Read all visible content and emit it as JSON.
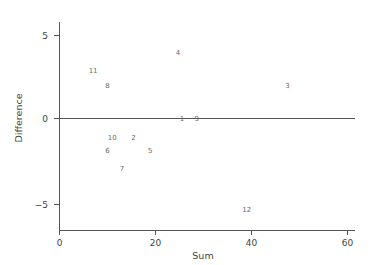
{
  "chart_data": {
    "type": "scatter",
    "title": "",
    "xlabel": "Sum",
    "ylabel": "Difference",
    "xlim": [
      0,
      60
    ],
    "ylim": [
      -6,
      6
    ],
    "xticks": [
      0,
      20,
      40,
      60
    ],
    "xticklabels": [
      "0",
      "20",
      "40",
      "60"
    ],
    "yticks": [
      5,
      0,
      -5
    ],
    "yticklabels": [
      "5",
      "0",
      "−5"
    ],
    "grid": false,
    "legend": null,
    "reference_line": {
      "orientation": "horizontal",
      "y": 0
    },
    "marker_style": "text-label",
    "points": [
      {
        "label": "11",
        "x": 7.0,
        "y": 2.9
      },
      {
        "label": "8",
        "x": 10.0,
        "y": 2.0
      },
      {
        "label": "4",
        "x": 24.7,
        "y": 4.0
      },
      {
        "label": "3",
        "x": 47.5,
        "y": 2.0
      },
      {
        "label": "1",
        "x": 25.5,
        "y": 0.0
      },
      {
        "label": "9",
        "x": 28.6,
        "y": 0.0
      },
      {
        "label": "10",
        "x": 11.0,
        "y": -1.15
      },
      {
        "label": "2",
        "x": 15.4,
        "y": -1.15
      },
      {
        "label": "6",
        "x": 10.0,
        "y": -1.95
      },
      {
        "label": "5",
        "x": 18.9,
        "y": -1.95
      },
      {
        "label": "7",
        "x": 13.0,
        "y": -3.0
      },
      {
        "label": "12",
        "x": 39.0,
        "y": -5.5
      }
    ]
  },
  "colors": {
    "axis": "#555555",
    "tick_label": "#444444",
    "point_label": "#6a6a6a",
    "background": "#ffffff"
  }
}
